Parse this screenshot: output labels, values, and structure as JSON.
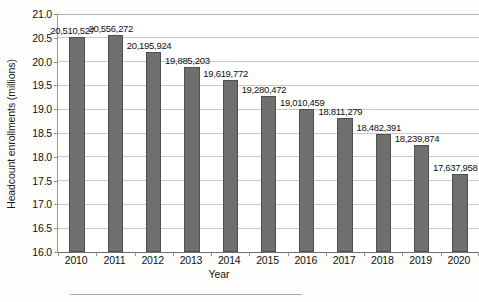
{
  "chart_data": {
    "type": "bar",
    "title": "",
    "xlabel": "Year",
    "ylabel": "Headcount enrollments (millions)",
    "categories": [
      "2010",
      "2011",
      "2012",
      "2013",
      "2014",
      "2015",
      "2016",
      "2017",
      "2018",
      "2019",
      "2020"
    ],
    "values": [
      20.510527,
      20.556272,
      20.195924,
      19.885203,
      19.619772,
      19.280472,
      19.010459,
      18.811279,
      18.482391,
      18.239874,
      17.637958
    ],
    "value_labels": [
      "20,510,527",
      "20,556,272",
      "20,195,924",
      "19,885,203",
      "19,619,772",
      "19,280,472",
      "19,010,459",
      "18,811,279",
      "18,482,391",
      "18,239,874",
      "17,637,958"
    ],
    "ylim": [
      16.0,
      21.0
    ],
    "ytick_labels": [
      "21.0",
      "20.5",
      "20.0",
      "19.5",
      "19.0",
      "18.5",
      "18.0",
      "17.5",
      "17.0",
      "16.5",
      "16.0"
    ],
    "ytick_values": [
      21.0,
      20.5,
      20.0,
      19.5,
      19.0,
      18.5,
      18.0,
      17.5,
      17.0,
      16.5,
      16.0
    ],
    "grid": true,
    "legend": false,
    "bar_color": "#6f6f6f",
    "grid_color": "#c9c9c9",
    "axis_color": "#6f6f6f"
  }
}
